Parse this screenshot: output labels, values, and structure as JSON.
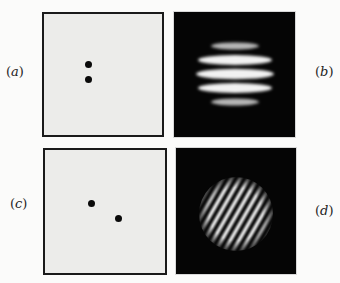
{
  "figure": {
    "panels": [
      {
        "id": "a",
        "label_open": "(",
        "label_letter": "a",
        "label_close": ")",
        "type": "aperture",
        "description": "two vertically separated pinholes"
      },
      {
        "id": "b",
        "label_open": "(",
        "label_letter": "b",
        "label_close": ")",
        "type": "diffraction",
        "description": "horizontal interference fringes"
      },
      {
        "id": "c",
        "label_open": "(",
        "label_letter": "c",
        "label_close": ")",
        "type": "aperture",
        "description": "two diagonally separated pinholes"
      },
      {
        "id": "d",
        "label_open": "(",
        "label_letter": "d",
        "label_close": ")",
        "type": "diffraction",
        "description": "tilted interference fringes in circular envelope"
      }
    ],
    "colors": {
      "aperture_bg": "#ececea",
      "pattern_bg": "#050505",
      "fringe": "#f2f2f2"
    }
  }
}
